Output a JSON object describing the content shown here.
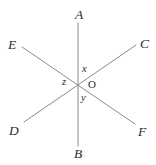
{
  "figure": {
    "background_color": "#ffffff",
    "line_color": "#8a8a8a",
    "text_color": "#2b2b2b",
    "width": 156,
    "height": 165,
    "origin": {
      "x": 78,
      "y": 83,
      "label": "O"
    },
    "lines": [
      {
        "name": "line-AB",
        "x1": 78,
        "y1": 23,
        "x2": 78,
        "y2": 146
      },
      {
        "name": "line-DC",
        "x1": 24,
        "y1": 122,
        "x2": 136,
        "y2": 45
      },
      {
        "name": "line-EF",
        "x1": 22,
        "y1": 47,
        "x2": 135,
        "y2": 124
      }
    ],
    "point_labels": [
      {
        "name": "label-A",
        "text": "A",
        "x": 75,
        "y": 8
      },
      {
        "name": "label-C",
        "text": "C",
        "x": 140,
        "y": 37
      },
      {
        "name": "label-E",
        "text": "E",
        "x": 8,
        "y": 38
      },
      {
        "name": "label-D",
        "text": "D",
        "x": 9,
        "y": 124
      },
      {
        "name": "label-F",
        "text": "F",
        "x": 138,
        "y": 125
      },
      {
        "name": "label-B",
        "text": "B",
        "x": 74,
        "y": 147
      }
    ],
    "angle_labels": [
      {
        "name": "label-x",
        "text": "x",
        "x": 82,
        "y": 64
      },
      {
        "name": "label-z",
        "text": "z",
        "x": 62,
        "y": 77
      },
      {
        "name": "label-y",
        "text": "y",
        "x": 81,
        "y": 93
      }
    ],
    "origin_label": {
      "name": "label-O",
      "text": "O",
      "x": 88,
      "y": 79
    }
  }
}
